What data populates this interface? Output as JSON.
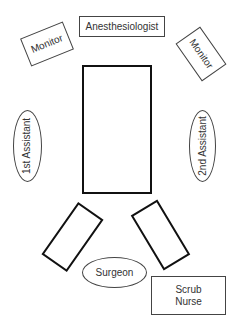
{
  "diagram": {
    "type": "room-layout",
    "nodes": {
      "anesthesiologist": {
        "label": "Anesthesiologist",
        "shape": "rectangle"
      },
      "monitor_left": {
        "label": "Monitor",
        "shape": "rotated-rectangle"
      },
      "monitor_right": {
        "label": "Monitor",
        "shape": "rotated-rectangle"
      },
      "operating_table": {
        "label": "",
        "shape": "rectangle-thick"
      },
      "first_assistant": {
        "label": "1st Assistant",
        "shape": "ellipse"
      },
      "second_assistant": {
        "label": "2nd Assistant",
        "shape": "ellipse"
      },
      "arm_board_left": {
        "label": "",
        "shape": "rotated-rectangle-thick"
      },
      "arm_board_right": {
        "label": "",
        "shape": "rotated-rectangle-thick"
      },
      "surgeon": {
        "label": "Surgeon",
        "shape": "ellipse"
      },
      "scrub_nurse": {
        "label_line1": "Scrub",
        "label_line2": "Nurse",
        "shape": "rectangle"
      }
    }
  }
}
